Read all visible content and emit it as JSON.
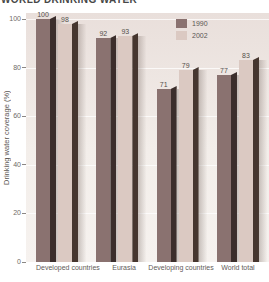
{
  "title": "WORLD DRINKING WATER",
  "chart_data": {
    "type": "bar",
    "title": "WORLD DRINKING WATER",
    "categories": [
      "Developed countries",
      "Eurasia",
      "Developing countries",
      "World total"
    ],
    "series": [
      {
        "name": "1990",
        "values": [
          100,
          92,
          71,
          77
        ],
        "color": "#8a7270",
        "side_color": "#3b2e2c"
      },
      {
        "name": "2002",
        "values": [
          98,
          93,
          79,
          83
        ],
        "color": "#dbc9c2",
        "side_color": "#46362f"
      }
    ],
    "xlabel": "",
    "ylabel": "Drinking water coverage (%)",
    "ylim": [
      0,
      100
    ],
    "yticks": [
      100,
      80,
      60,
      40,
      20,
      0
    ],
    "grid": "horizontal",
    "legend_position": "top-right"
  },
  "colors": {
    "panel_top": "#e9dfdb",
    "panel_bottom": "#f6f2ef",
    "gridline": "#ffffff",
    "tick_text": "#6e6a66",
    "label_text": "#5f5b58",
    "value_text": "#544f4b",
    "title_text": "#474747"
  }
}
